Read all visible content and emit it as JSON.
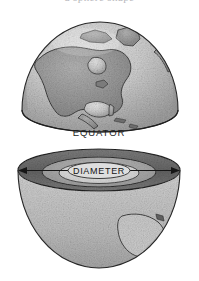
{
  "figure": {
    "clipped_top_caption": "a sphere shape",
    "background_color": "#ffffff",
    "outline_color": "#2b2b2b"
  },
  "labels": {
    "equator": "EQUATOR",
    "diameter": "DIAMETER"
  },
  "upper_hemisphere": {
    "name": "globe-upper-hemisphere",
    "ocean_color": "#c8c8c8",
    "land_color": "#9a9a9a",
    "highlight_color": "#e4e4e4",
    "shadow_color": "#8e8e8e",
    "features": [
      "Greenland",
      "Canada",
      "Hudson Bay",
      "Great Lakes",
      "United States",
      "Mexico",
      "Gulf of Mexico",
      "Florida",
      "Caribbean Islands",
      "Central America"
    ]
  },
  "lower_hemisphere": {
    "name": "globe-lower-hemisphere-cutaway",
    "crust_ring_color": "#6f6f6f",
    "mantle_ring_color": "#a8a8a8",
    "core_disc_color": "#d6d6d6",
    "outer_shell_color": "#bdbdbd",
    "landmass_color": "#cfcfcf",
    "features": [
      "cross-section rings",
      "southern landmass"
    ]
  },
  "diameter_arrow": {
    "name": "diameter-measure-arrow",
    "color": "#1e1e1e",
    "left_arrow": "◀",
    "right_arrow": "▶"
  }
}
